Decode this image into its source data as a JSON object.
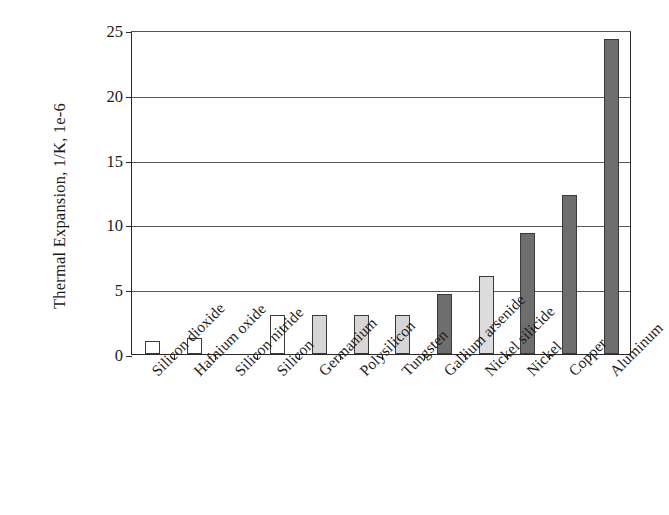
{
  "chart_data": {
    "type": "bar",
    "title": "",
    "xlabel": "",
    "ylabel": "Thermal Expansion, 1/K, 1e-6",
    "ylim": [
      0,
      25
    ],
    "yticks": [
      0,
      5,
      10,
      15,
      20,
      25
    ],
    "ytick_labels": [
      "0",
      "5",
      "10",
      "15",
      "20",
      "25"
    ],
    "grid": "horizontal",
    "legend": "none",
    "categories": [
      "Silicon dioxide",
      "Hafnium oxide",
      "Silicon nitride",
      "Silicon",
      "Germanium",
      "Polysilicon",
      "Tungsten",
      "Gallium arsenide",
      "Nickel silicide",
      "Nickel",
      "Copper",
      "Aluminum"
    ],
    "values": [
      1.0,
      1.2,
      0.0,
      3.0,
      3.0,
      3.0,
      3.0,
      4.6,
      6.0,
      9.3,
      12.3,
      24.3
    ],
    "bar_fills": [
      "#ffffff",
      "#ffffff",
      "#ffffff",
      "#ffffff",
      "#d6d6d6",
      "#d6d6d6",
      "#d6d6d6",
      "#6e6e6e",
      "#dcdcdc",
      "#6e6e6e",
      "#6e6e6e",
      "#6e6e6e"
    ],
    "bar_edge_color": "#3a3a3a",
    "axis_color": "#2b2b2b",
    "grid_color": "#595959",
    "background_color": "#ffffff"
  }
}
